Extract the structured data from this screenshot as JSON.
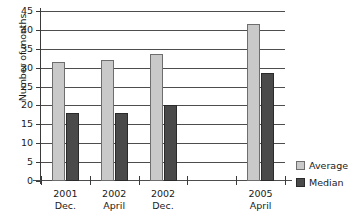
{
  "chart_data": {
    "type": "bar",
    "title": "",
    "xlabel": "",
    "ylabel": "Number of months",
    "ylim": [
      0,
      45
    ],
    "yticks": [
      0,
      5,
      10,
      15,
      20,
      25,
      30,
      35,
      40,
      45
    ],
    "grid": true,
    "legend_position": "right",
    "categories": [
      "2001\nDec.",
      "2002\nApril",
      "2002\nDec.",
      "",
      "2005\nApril"
    ],
    "category_lines": [
      [
        "2001",
        "Dec."
      ],
      [
        "2002",
        "April"
      ],
      [
        "2002",
        "Dec."
      ],
      [
        "",
        ""
      ],
      [
        "2005",
        "April"
      ]
    ],
    "series": [
      {
        "name": "Average",
        "color": "#c9c9c9",
        "values": [
          31.5,
          32,
          33.5,
          null,
          41.5
        ]
      },
      {
        "name": "Median",
        "color": "#4a4a4a",
        "values": [
          18,
          18,
          20,
          null,
          28.5
        ]
      }
    ]
  },
  "axis": {
    "y_title": "Number of months",
    "tick_labels": [
      "0",
      "5",
      "10",
      "15",
      "20",
      "25",
      "30",
      "35",
      "40",
      "45"
    ]
  },
  "legend": {
    "items": [
      {
        "label": "Average"
      },
      {
        "label": "Median"
      }
    ]
  }
}
